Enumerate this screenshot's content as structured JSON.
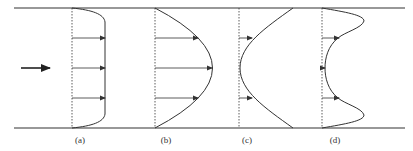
{
  "figure": {
    "labels": [
      "(a)",
      "(b)",
      "(c)",
      "(d)"
    ],
    "colors": {
      "line": "#333333",
      "background": "#ffffff"
    },
    "flow_arrow": "flow-direction-arrow",
    "profiles": [
      {
        "id": "a",
        "label": "(a)",
        "description": "plug-like flat velocity profile",
        "arrows": 3
      },
      {
        "id": "b",
        "label": "(b)",
        "description": "parabolic velocity profile",
        "arrows": 3
      },
      {
        "id": "c",
        "label": "(c)",
        "description": "concave velocity profile, minimum at centre",
        "arrows": 3
      },
      {
        "id": "d",
        "label": "(d)",
        "description": "near-wall peaks with central dip",
        "arrows": 3
      }
    ]
  }
}
